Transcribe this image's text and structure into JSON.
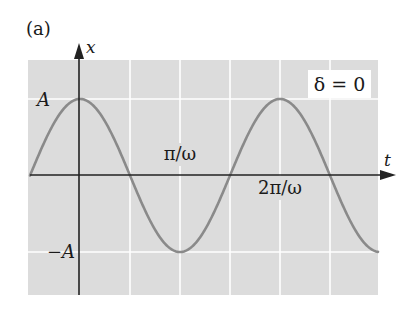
{
  "panel_label": "(a)",
  "phase_box": {
    "text": "δ = 0"
  },
  "axes": {
    "y_label": "x",
    "x_label": "t"
  },
  "y_ticks": {
    "pos": "A",
    "neg": "−A"
  },
  "x_ticks": {
    "half_period": "π/ω",
    "full_period": "2π/ω"
  },
  "colors": {
    "panel_background": "#dcdcdc",
    "gridline": "#ffffff",
    "curve": "#8a8a8a",
    "axis": "#222222",
    "text": "#1a1a1a"
  },
  "chart_data": {
    "type": "line",
    "xlabel": "t",
    "ylabel": "x",
    "function": "x = A cos(ωt + δ), δ = 0",
    "series": [
      {
        "name": "x(t)",
        "x_in_units_of_pi_over_omega": [
          -1,
          -0.5,
          0,
          0.5,
          1,
          1.5,
          2,
          2.5,
          3,
          3.5
        ],
        "values_in_units_of_A": [
          -1,
          0,
          1,
          0,
          -1,
          0,
          1,
          0,
          -1,
          -0.7
        ]
      }
    ],
    "x_ticks": [
      "π/ω",
      "2π/ω"
    ],
    "y_ticks": [
      "A",
      "−A"
    ],
    "ylim": [
      -1.3,
      1.3
    ],
    "grid": true
  }
}
